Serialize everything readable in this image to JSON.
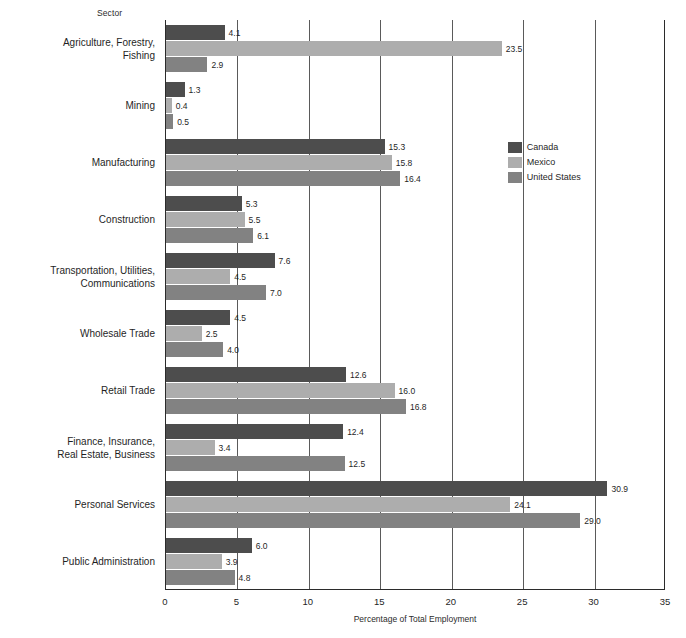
{
  "axis": {
    "y_header": "Sector",
    "x_title": "Percentage of Total Employment",
    "x_ticks": [
      "0",
      "5",
      "10",
      "15",
      "20",
      "25",
      "30",
      "35"
    ]
  },
  "legend": {
    "items": [
      {
        "label": "Canada",
        "color": "#4d4d4d"
      },
      {
        "label": "Mexico",
        "color": "#adadad"
      },
      {
        "label": "United States",
        "color": "#828282"
      }
    ]
  },
  "values": {
    "agriculture": {
      "canada": "4.1",
      "mexico": "23.5",
      "united_states": "2.9"
    },
    "mining": {
      "canada": "1.3",
      "mexico": "0.4",
      "united_states": "0.5"
    },
    "manufacturing": {
      "canada": "15.3",
      "mexico": "15.8",
      "united_states": "16.4"
    },
    "construction": {
      "canada": "5.3",
      "mexico": "5.5",
      "united_states": "6.1"
    },
    "transport": {
      "canada": "7.6",
      "mexico": "4.5",
      "united_states": "7.0"
    },
    "wholesale": {
      "canada": "4.5",
      "mexico": "2.5",
      "united_states": "4.0"
    },
    "retail": {
      "canada": "12.6",
      "mexico": "16.0",
      "united_states": "16.8"
    },
    "finance": {
      "canada": "12.4",
      "mexico": "3.4",
      "united_states": "12.5"
    },
    "personal": {
      "canada": "30.9",
      "mexico": "24.1",
      "united_states": "29.0"
    },
    "public": {
      "canada": "6.0",
      "mexico": "3.9",
      "united_states": "4.8"
    }
  },
  "categories": {
    "agriculture": "Agriculture, Forestry,\nFishing",
    "mining": "Mining",
    "manufacturing": "Manufacturing",
    "construction": "Construction",
    "transport": "Transportation, Utilities,\nCommunications",
    "wholesale": "Wholesale Trade",
    "retail": "Retail Trade",
    "finance": "Finance, Insurance,\nReal Estate, Business",
    "personal": "Personal Services",
    "public": "Public Administration"
  },
  "chart_data": {
    "type": "bar",
    "orientation": "horizontal",
    "title": "",
    "xlabel": "Percentage of Total Employment",
    "ylabel": "Sector",
    "xlim": [
      0,
      35
    ],
    "xticks": [
      0,
      5,
      10,
      15,
      20,
      25,
      30,
      35
    ],
    "grid": "vertical",
    "legend_position": "upper-right-inside",
    "categories": [
      "Agriculture, Forestry, Fishing",
      "Mining",
      "Manufacturing",
      "Construction",
      "Transportation, Utilities, Communications",
      "Wholesale Trade",
      "Retail Trade",
      "Finance, Insurance, Real Estate, Business",
      "Personal Services",
      "Public Administration"
    ],
    "series": [
      {
        "name": "Canada",
        "color": "#4d4d4d",
        "values": [
          4.1,
          1.3,
          15.3,
          5.3,
          7.6,
          4.5,
          12.6,
          12.4,
          30.9,
          6.0
        ]
      },
      {
        "name": "Mexico",
        "color": "#adadad",
        "values": [
          23.5,
          0.4,
          15.8,
          5.5,
          4.5,
          2.5,
          16.0,
          3.4,
          24.1,
          3.9
        ]
      },
      {
        "name": "United States",
        "color": "#828282",
        "values": [
          2.9,
          0.5,
          16.4,
          6.1,
          7.0,
          4.0,
          16.8,
          12.5,
          29.0,
          4.8
        ]
      }
    ]
  },
  "geometry": {
    "plot_left": 165,
    "plot_right": 665,
    "plot_top": 20,
    "plot_bottom": 590
  }
}
